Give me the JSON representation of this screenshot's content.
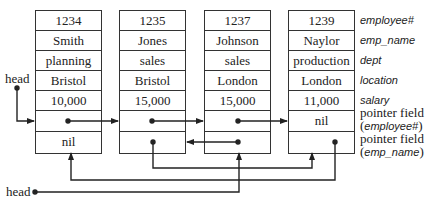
{
  "records": [
    {
      "employee_no": "1234",
      "emp_name": "Smith",
      "dept": "planning",
      "location": "Bristol",
      "salary": "10,000",
      "ptr_employee": "",
      "ptr_emp_name": "nil"
    },
    {
      "employee_no": "1235",
      "emp_name": "Jones",
      "dept": "sales",
      "location": "Bristol",
      "salary": "15,000",
      "ptr_employee": "",
      "ptr_emp_name": ""
    },
    {
      "employee_no": "1237",
      "emp_name": "Johnson",
      "dept": "sales",
      "location": "London",
      "salary": "15,000",
      "ptr_employee": "",
      "ptr_emp_name": ""
    },
    {
      "employee_no": "1239",
      "emp_name": "Naylor",
      "dept": "production",
      "location": "London",
      "salary": "11,000",
      "ptr_employee": "nil",
      "ptr_emp_name": ""
    }
  ],
  "field_labels": {
    "employee_no": "employee#",
    "emp_name": "emp_name",
    "dept": "dept",
    "location": "location",
    "salary": "salary",
    "ptr_employee_line1": "pointer field",
    "ptr_employee_line2": "employee#",
    "ptr_emp_name_line1": "pointer field",
    "ptr_emp_name_line2": "emp_name"
  },
  "head_labels": {
    "employee_list_head": "head",
    "emp_name_list_head": "head"
  },
  "colors": {
    "line": "#222222",
    "border": "#333333"
  }
}
